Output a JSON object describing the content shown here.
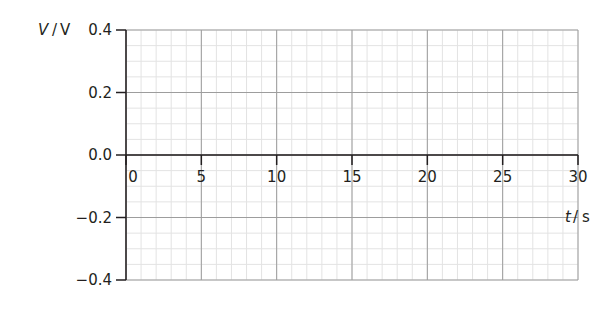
{
  "chart_data": {
    "type": "line",
    "title": "",
    "xlabel_var": "t",
    "xlabel_unit": "s",
    "ylabel_var": "V",
    "ylabel_unit": "V",
    "x_ticks": [
      "0",
      "5",
      "10",
      "15",
      "20",
      "25",
      "30"
    ],
    "y_ticks": [
      "0.4",
      "0.2",
      "0.0",
      "−0.2",
      "−0.4"
    ],
    "xlim": [
      0,
      30
    ],
    "ylim": [
      -0.4,
      0.4
    ],
    "grid": true,
    "minor_grid_x_step": 1,
    "minor_grid_y_step": 0.05,
    "series": [],
    "note": "Blank grid for plotting voltage against time"
  },
  "colors": {
    "axis": "#231f20",
    "major_grid": "#9d9d9d",
    "minor_grid": "#e3e3e3"
  }
}
